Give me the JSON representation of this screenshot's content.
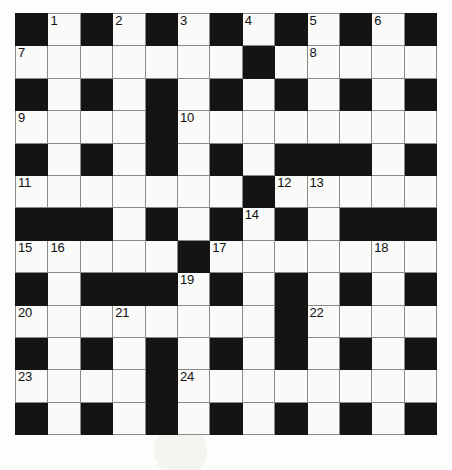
{
  "puzzle": {
    "type": "crossword-grid",
    "title": "Crossword puzzle grid",
    "columns": 13,
    "rows": 13,
    "colors": {
      "block": "#141414",
      "cell": "#fafaf8",
      "grid_line": "#8a8a8a",
      "number": "#111111",
      "page_background": "#fdfdfb"
    },
    "legend": {
      "block_char": "#",
      "open_char": "."
    },
    "grid": [
      "#.#.#.#.#.#.#",
      ".......#.....",
      "#.#.#.#.#.#.#",
      "....#........",
      "#.#.#.#.###.#",
      ".......#.....",
      "###.#.#.#.###",
      ".....#.......",
      "#.###.#.#.#.#",
      "........#....",
      "#.#.#.#.#.#.#",
      "....#........",
      "#.#.#.#.#.#.#"
    ],
    "numbers": [
      {
        "label": "1",
        "row": 0,
        "col": 1
      },
      {
        "label": "2",
        "row": 0,
        "col": 3
      },
      {
        "label": "3",
        "row": 0,
        "col": 5
      },
      {
        "label": "4",
        "row": 0,
        "col": 7
      },
      {
        "label": "5",
        "row": 0,
        "col": 9
      },
      {
        "label": "6",
        "row": 0,
        "col": 11
      },
      {
        "label": "7",
        "row": 1,
        "col": 0
      },
      {
        "label": "8",
        "row": 1,
        "col": 9
      },
      {
        "label": "9",
        "row": 3,
        "col": 0
      },
      {
        "label": "10",
        "row": 3,
        "col": 5
      },
      {
        "label": "11",
        "row": 5,
        "col": 0
      },
      {
        "label": "12",
        "row": 5,
        "col": 8
      },
      {
        "label": "13",
        "row": 5,
        "col": 9
      },
      {
        "label": "14",
        "row": 6,
        "col": 7
      },
      {
        "label": "15",
        "row": 7,
        "col": 0
      },
      {
        "label": "16",
        "row": 7,
        "col": 1
      },
      {
        "label": "17",
        "row": 7,
        "col": 6
      },
      {
        "label": "18",
        "row": 7,
        "col": 11
      },
      {
        "label": "19",
        "row": 8,
        "col": 5
      },
      {
        "label": "20",
        "row": 9,
        "col": 0
      },
      {
        "label": "21",
        "row": 9,
        "col": 3
      },
      {
        "label": "22",
        "row": 9,
        "col": 9
      },
      {
        "label": "23",
        "row": 11,
        "col": 0
      },
      {
        "label": "24",
        "row": 11,
        "col": 5
      }
    ]
  }
}
